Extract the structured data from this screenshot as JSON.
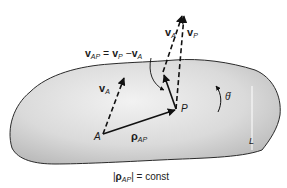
{
  "diagram": {
    "points": {
      "A": {
        "label": "A"
      },
      "P": {
        "label": "P"
      },
      "L": {
        "label": "L"
      }
    },
    "labels": {
      "vA_at_A": {
        "main": "v",
        "sub": "A"
      },
      "vA_at_P": {
        "main": "v",
        "sub": "A"
      },
      "vP": {
        "main": "v",
        "sub": "P"
      },
      "rhoAP": {
        "main": "ρ",
        "sub": "AP"
      },
      "equation": {
        "lhs_main": "v",
        "lhs_sub": "AP",
        "eq": "=",
        "t1_main": "v",
        "t1_sub": "P",
        "minus": "−",
        "t2_main": "v",
        "t2_sub": "A"
      },
      "theta_dot": "θ̇"
    },
    "caption": {
      "open": "|",
      "main": "ρ",
      "sub": "AP",
      "close": "|",
      "rest": " = const"
    },
    "colors": {
      "body_fill": "#d4d4d4",
      "body_edge": "#2a2a2a",
      "arrow": "#111111"
    }
  }
}
